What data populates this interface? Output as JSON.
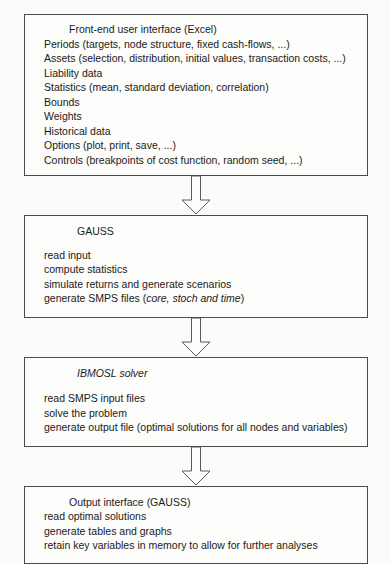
{
  "diagram": {
    "orientation": "vertical",
    "connector_icon": "down-block-arrow-icon",
    "stages": [
      {
        "id": "front-end-user-interface",
        "title": "Front-end user interface (Excel)",
        "title_style": "regular",
        "lines": [
          "Periods (targets, node structure, fixed cash-flows, ...)",
          "Assets (selection, distribution, initial values, transaction costs, ...)",
          "Liability data",
          "Statistics (mean, standard deviation, correlation)",
          "Bounds",
          "Weights",
          "Historical data",
          "Options (plot, print, save, ...)",
          "Controls (breakpoints of cost function, random seed, ...)"
        ]
      },
      {
        "id": "gauss",
        "title": "GAUSS",
        "title_style": "regular",
        "lines": [
          "read input",
          "compute statistics",
          "simulate returns and generate scenarios"
        ],
        "last_line": {
          "prefix": "generate SMPS files (",
          "italic": "core, stoch and time",
          "suffix": ")"
        }
      },
      {
        "id": "ibmosl-solver",
        "title": "IBMOSL solver",
        "title_style": "italic",
        "lines": [
          "read SMPS input files",
          "solve the problem",
          "generate output file (optimal solutions for all nodes and variables)"
        ]
      },
      {
        "id": "output-interface",
        "title": "Output interface (GAUSS)",
        "title_style": "regular",
        "lines": [
          "read optimal solutions",
          "generate tables and graphs",
          "retain key variables in memory to allow for further analyses"
        ]
      }
    ],
    "colors": {
      "background": "#fbfbf9",
      "box_fill": "#fdfdfb",
      "box_border": "#4a4a4a",
      "text": "#1a1a1a",
      "arrow_stroke": "#5a5a5a"
    }
  }
}
